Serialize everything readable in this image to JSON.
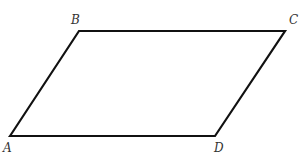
{
  "figure": {
    "shape": "parallelogram",
    "stroke_color": "#111111",
    "label_color": "#333333",
    "vertices": [
      {
        "name": "A",
        "x": 10,
        "y": 136,
        "label_x": 3,
        "label_y": 152
      },
      {
        "name": "B",
        "x": 79,
        "y": 31,
        "label_x": 71,
        "label_y": 24
      },
      {
        "name": "C",
        "x": 285,
        "y": 31,
        "label_x": 289,
        "label_y": 24
      },
      {
        "name": "D",
        "x": 215,
        "y": 136,
        "label_x": 214,
        "label_y": 152
      }
    ],
    "labels": {
      "A": "A",
      "B": "B",
      "C": "C",
      "D": "D"
    }
  }
}
